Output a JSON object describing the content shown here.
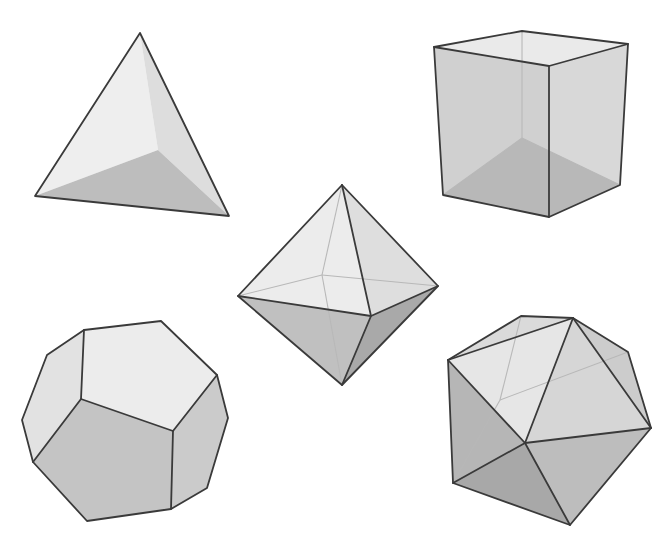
{
  "colors": {
    "background": "#ffffff",
    "edge": "#3a3a3a",
    "hidden_edge": "#b8b8b8",
    "light_face": "#ececec",
    "mid_face": "#d2d2d2",
    "dark_face": "#b4b4b4"
  },
  "solids": [
    {
      "name": "tetrahedron",
      "faces": [
        {
          "points": "140,33 35,196 158,150",
          "fill": "#eeeeee"
        },
        {
          "points": "140,33 158,150 229,216",
          "fill": "#dddddd"
        },
        {
          "points": "35,196 158,150 229,216",
          "fill": "#bdbdbd"
        }
      ],
      "hidden": [],
      "edges": [
        "140,33 35,196 229,216 140,33"
      ]
    },
    {
      "name": "cube",
      "faces": [
        {
          "points": "434,47 522,31 628,44 549,66",
          "fill": "#eaeaea"
        },
        {
          "points": "434,47 549,66 549,217 443,195",
          "fill": "#d0d0d0"
        },
        {
          "points": "549,66 628,44 620,185 549,217",
          "fill": "#d8d8d8"
        },
        {
          "points": "443,195 522,138 620,185 549,217",
          "fill": "#b8b8b8"
        }
      ],
      "hidden": [
        "522,31 522,138",
        "443,195 522,138",
        "522,138 620,185"
      ],
      "edges": [
        "434,47 522,31 628,44 620,185 549,217 443,195 434,47",
        "434,47 549,66 628,44",
        "549,66 549,217"
      ]
    },
    {
      "name": "octahedron",
      "faces": [
        {
          "points": "342,185 238,296 371,316",
          "fill": "#ececec"
        },
        {
          "points": "342,185 371,316 438,286",
          "fill": "#dedede"
        },
        {
          "points": "238,296 371,316 342,385",
          "fill": "#c0c0c0"
        },
        {
          "points": "371,316 438,286 342,385",
          "fill": "#a9a9a9"
        }
      ],
      "hidden": [
        "342,185 322,275",
        "238,296 322,275",
        "322,275 438,286",
        "322,275 342,385"
      ],
      "edges": [
        "342,185 238,296 342,385 438,286 342,185",
        "238,296 371,316 438,286",
        "342,185 371,316 342,385"
      ]
    },
    {
      "name": "dodecahedron",
      "faces": [
        {
          "points": "84,330 161,321 217,375 173,431 81,399",
          "fill": "#ececec"
        },
        {
          "points": "84,330 81,399 33,462 22,420 47,355",
          "fill": "#e2e2e2"
        },
        {
          "points": "81,399 173,431 171,509 87,521 33,462",
          "fill": "#c4c4c4"
        },
        {
          "points": "173,431 217,375 228,418 207,488 171,509",
          "fill": "#cbcbcb"
        }
      ],
      "hidden": [],
      "edges": [
        "84,330 161,321 217,375 228,418 207,488 171,509 87,521 33,462 22,420 47,355 84,330",
        "84,330 81,399 173,431 217,375",
        "81,399 33,462",
        "173,431 171,509"
      ]
    },
    {
      "name": "icosahedron",
      "faces": [
        {
          "points": "448,360 573,318 525,443",
          "fill": "#e6e6e6"
        },
        {
          "points": "573,318 651,428 525,443",
          "fill": "#d6d6d6"
        },
        {
          "points": "448,360 525,443 453,483",
          "fill": "#b6b6b6"
        },
        {
          "points": "453,483 525,443 570,525",
          "fill": "#a8a8a8"
        },
        {
          "points": "525,443 651,428 570,525",
          "fill": "#bdbdbd"
        },
        {
          "points": "448,360 521,316 573,318",
          "fill": "#dadada"
        },
        {
          "points": "573,318 628,352 651,428",
          "fill": "#cccccc"
        }
      ],
      "hidden": [
        "521,316 500,400",
        "500,400 628,352",
        "500,400 453,483"
      ],
      "edges": [
        "448,360 521,316 573,318 628,352 651,428 570,525 453,483 448,360",
        "448,360 573,318",
        "573,318 651,428",
        "448,360 525,443 573,318",
        "525,443 651,428",
        "525,443 570,525",
        "525,443 453,483"
      ]
    }
  ]
}
